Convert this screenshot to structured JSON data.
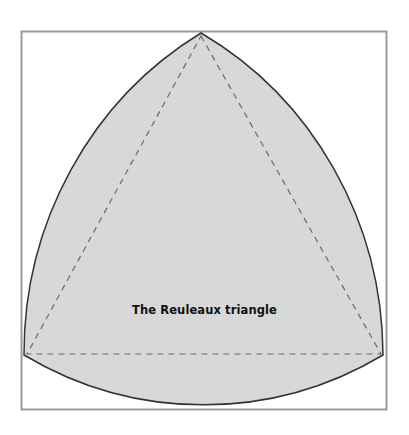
{
  "diagram": {
    "title": "The Reuleaux triangle",
    "colors": {
      "fill": "#d8d8d8",
      "outline": "#333333",
      "frame": "#9a9a9a",
      "dashes": "#6a6a6a",
      "background": "#ffffff"
    },
    "vertices": {
      "top": [
        201,
        33
      ],
      "bottom_left": [
        24,
        355
      ],
      "bottom_right": [
        383,
        355
      ]
    }
  }
}
